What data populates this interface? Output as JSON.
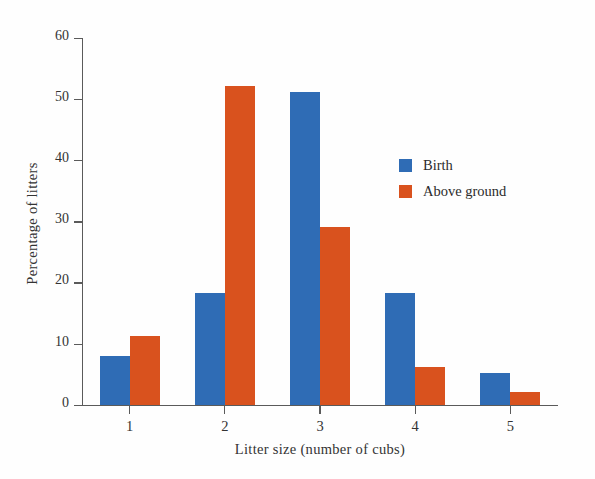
{
  "chart_data": {
    "type": "bar",
    "title": "",
    "xlabel": "Litter size (number of cubs)",
    "ylabel": "Percentage of litters",
    "categories": [
      "1",
      "2",
      "3",
      "4",
      "5"
    ],
    "series": [
      {
        "name": "Birth",
        "color": "#2f6cb5",
        "values": [
          8.0,
          18.2,
          51.2,
          18.2,
          5.1
        ]
      },
      {
        "name": "Above ground",
        "color": "#d9521e",
        "values": [
          11.3,
          52.2,
          29.0,
          6.2,
          2.0
        ]
      }
    ],
    "ylim": [
      0,
      60
    ],
    "yticks": [
      0,
      10,
      20,
      30,
      40,
      50,
      60
    ],
    "ytick_labels": [
      "0",
      "10",
      "20",
      "30",
      "40",
      "50",
      "60"
    ],
    "grid": false,
    "legend_position": "inside-upper-right"
  },
  "legend": {
    "items": [
      {
        "label": "Birth"
      },
      {
        "label": "Above ground"
      }
    ]
  }
}
